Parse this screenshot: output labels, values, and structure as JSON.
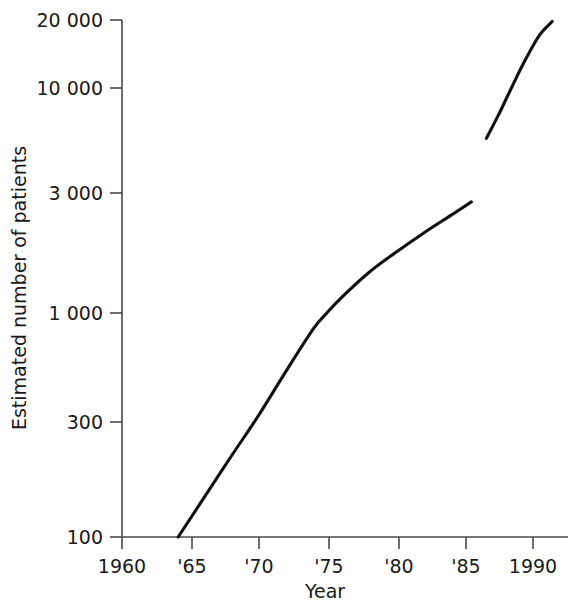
{
  "chart_data": {
    "type": "line",
    "title": "",
    "xlabel": "Year",
    "ylabel": "Estimated number of patients",
    "yscale": "log",
    "xscale": "linear",
    "grid": false,
    "legend": false,
    "xlim": [
      1960,
      1992.5
    ],
    "ylim": [
      100,
      20000
    ],
    "xticks": [
      1960,
      1965,
      1970,
      1975,
      1980,
      1985,
      1990
    ],
    "xticklabels": [
      "1960",
      "'65",
      "'70",
      "'75",
      "'80",
      "'85",
      "1990"
    ],
    "yticks": [
      100,
      300,
      1000,
      3000,
      10000,
      20000
    ],
    "yticklabels": [
      "100",
      "300",
      "1 000",
      "3 000",
      "10 000",
      "20 000"
    ],
    "series": [
      {
        "name": "segment-1",
        "x": [
          1964.1,
          1966,
          1968,
          1970,
          1972,
          1974,
          1975,
          1976,
          1978,
          1980,
          1982,
          1984,
          1985.5
        ],
        "y": [
          100,
          150,
          230,
          350,
          550,
          850,
          1000,
          1160,
          1500,
          1850,
          2250,
          2700,
          3100
        ]
      },
      {
        "name": "segment-2",
        "x": [
          1986.6,
          1987.5,
          1988.5,
          1989.5,
          1990.5,
          1991.4
        ],
        "y": [
          5950,
          7600,
          10200,
          13500,
          17200,
          19700
        ]
      }
    ]
  },
  "axis": {
    "y_title": "Estimated number of patients",
    "x_title": "Year",
    "tick_100": "100",
    "tick_300": "300",
    "tick_1000": "1 000",
    "tick_3000": "3 000",
    "tick_10000": "10 000",
    "tick_20000": "20 000",
    "xtick_1960": "1960",
    "xtick_65": "'65",
    "xtick_70": "'70",
    "xtick_75": "'75",
    "xtick_80": "'80",
    "xtick_85": "'85",
    "xtick_1990": "1990"
  }
}
